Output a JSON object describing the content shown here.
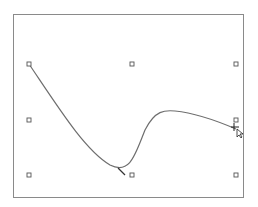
{
  "canvas": {
    "border_color": "#8a8a8a",
    "curve_color": "#6e6e6e",
    "handle_color": "#555555"
  },
  "selection_handles": [
    {
      "name": "handle-top-left",
      "x": 29,
      "y": 64
    },
    {
      "name": "handle-top-center",
      "x": 132,
      "y": 64
    },
    {
      "name": "handle-top-right",
      "x": 236,
      "y": 64
    },
    {
      "name": "handle-middle-left",
      "x": 29,
      "y": 120
    },
    {
      "name": "handle-middle-right",
      "x": 236,
      "y": 120
    },
    {
      "name": "handle-bottom-left",
      "x": 29,
      "y": 175
    },
    {
      "name": "handle-bottom-center",
      "x": 132,
      "y": 175
    },
    {
      "name": "handle-bottom-right",
      "x": 236,
      "y": 175
    }
  ],
  "curve": {
    "path": "M29,64 C60,110 85,150 110,165 C130,175 135,155 145,130 C155,110 165,110 175,111 C195,113 215,120 236,129"
  },
  "cursor": {
    "icon": "move-cursor-icon",
    "x": 236,
    "y": 129
  }
}
